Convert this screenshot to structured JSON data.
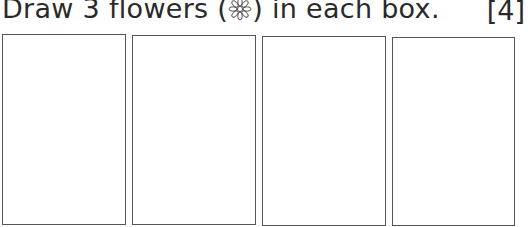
{
  "question": {
    "text_before": "Draw 3 flowers (",
    "icon": "flower-icon",
    "text_after": ") in each box.",
    "marks": "[4]"
  },
  "boxes": [
    {
      "label": "box-1",
      "content": ""
    },
    {
      "label": "box-2",
      "content": ""
    },
    {
      "label": "box-3",
      "content": ""
    },
    {
      "label": "box-4",
      "content": ""
    }
  ]
}
